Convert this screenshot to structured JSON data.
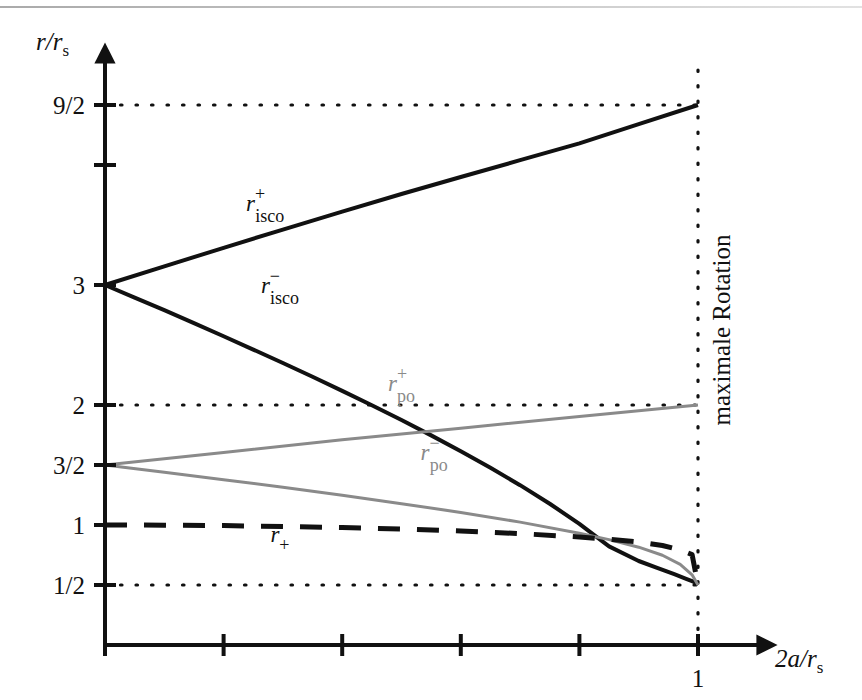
{
  "figure": {
    "background": "#ffffff",
    "ink_color": "#111111",
    "gray_color": "#8a8a8a"
  },
  "axes": {
    "y_title": "r/r",
    "y_title_sub": "s",
    "x_title": "2a/r",
    "x_title_sub": "s",
    "x_ticks": [
      {
        "value": 0.0,
        "label": ""
      },
      {
        "value": 0.2,
        "label": ""
      },
      {
        "value": 0.4,
        "label": ""
      },
      {
        "value": 0.6,
        "label": ""
      },
      {
        "value": 0.8,
        "label": ""
      },
      {
        "value": 1.0,
        "label": "1"
      }
    ],
    "y_ticks": [
      {
        "value": 4.5,
        "label": "9/2",
        "grid": "dotted"
      },
      {
        "value": 4.0,
        "label": "",
        "grid": "none"
      },
      {
        "value": 3.0,
        "label": "3",
        "grid": "none"
      },
      {
        "value": 2.0,
        "label": "2",
        "grid": "dotted"
      },
      {
        "value": 1.5,
        "label": "3/2",
        "grid": "none"
      },
      {
        "value": 1.0,
        "label": "1",
        "grid": "none"
      },
      {
        "value": 0.5,
        "label": "1/2",
        "grid": "dotted"
      }
    ],
    "xlim": [
      0,
      1.12
    ],
    "ylim": [
      0,
      5.0
    ]
  },
  "annotations": {
    "max_rotation": "maximale Rotation",
    "max_rotation_x": 1.0
  },
  "chart_data": {
    "type": "line",
    "title": "",
    "xlabel": "2a/r_s",
    "ylabel": "r/r_s",
    "xlim": [
      0,
      1.12
    ],
    "ylim": [
      0,
      5.0
    ],
    "grid": "dotted horizontal lines at 9/2, 2, 1/2; dotted vertical line at x=1",
    "legend": "inline curve labels",
    "series": [
      {
        "name": "r_isco^+",
        "label": "r",
        "sup": "+",
        "sub": "isco",
        "color": "#111111",
        "style": "solid",
        "width": 4,
        "label_x": 0.27,
        "label_y": 3.62,
        "x": [
          0.0,
          0.1,
          0.2,
          0.3,
          0.4,
          0.5,
          0.6,
          0.7,
          0.8,
          0.9,
          1.0
        ],
        "y": [
          3.0,
          3.155,
          3.31,
          3.462,
          3.612,
          3.758,
          3.9,
          4.04,
          4.18,
          4.34,
          4.5
        ]
      },
      {
        "name": "r_isco^-",
        "label": "r",
        "sup": "−",
        "sub": "isco",
        "color": "#111111",
        "style": "solid",
        "width": 4,
        "label_x": 0.295,
        "label_y": 2.93,
        "x": [
          0.0,
          0.05,
          0.1,
          0.15,
          0.2,
          0.25,
          0.3,
          0.35,
          0.4,
          0.45,
          0.5,
          0.55,
          0.6,
          0.65,
          0.7,
          0.75,
          0.8,
          0.85,
          0.9,
          0.93,
          0.96,
          0.98,
          0.99,
          0.995,
          1.0
        ],
        "y": [
          3.0,
          2.895,
          2.79,
          2.682,
          2.573,
          2.462,
          2.35,
          2.235,
          2.118,
          1.998,
          1.875,
          1.747,
          1.615,
          1.477,
          1.332,
          1.177,
          1.01,
          0.822,
          0.7,
          0.645,
          0.59,
          0.552,
          0.532,
          0.521,
          0.5
        ]
      },
      {
        "name": "r_po^+",
        "label": "r",
        "sup": "+",
        "sub": "po",
        "color": "#8a8a8a",
        "style": "solid",
        "width": 3,
        "label_x": 0.5,
        "label_y": 2.12,
        "x": [
          0.0,
          0.2,
          0.4,
          0.6,
          0.8,
          1.0
        ],
        "y": [
          1.5,
          1.605,
          1.71,
          1.807,
          1.905,
          2.0
        ]
      },
      {
        "name": "r_po^-",
        "label": "r",
        "sup": "−",
        "sub": "po",
        "color": "#8a8a8a",
        "style": "solid",
        "width": 3,
        "label_x": 0.555,
        "label_y": 1.545,
        "x": [
          0.0,
          0.1,
          0.2,
          0.3,
          0.4,
          0.5,
          0.6,
          0.7,
          0.8,
          0.85,
          0.9,
          0.94,
          0.97,
          0.99,
          1.0
        ],
        "y": [
          1.5,
          1.44,
          1.378,
          1.315,
          1.248,
          1.178,
          1.105,
          1.024,
          0.932,
          0.878,
          0.815,
          0.748,
          0.672,
          0.585,
          0.5
        ]
      },
      {
        "name": "r_+",
        "label": "r",
        "sup": "",
        "sub": "+",
        "color": "#111111",
        "style": "dashed",
        "width": 5,
        "label_x": 0.295,
        "label_y": 0.855,
        "x": [
          0.0,
          0.1,
          0.2,
          0.3,
          0.4,
          0.5,
          0.6,
          0.7,
          0.8,
          0.85,
          0.9,
          0.94,
          0.97,
          0.99,
          1.0
        ],
        "y": [
          1.0,
          0.9987,
          0.9949,
          0.9881,
          0.9789,
          0.9665,
          0.95,
          0.9285,
          0.9,
          0.8816,
          0.8588,
          0.8293,
          0.7926,
          0.7535,
          0.5
        ]
      }
    ]
  }
}
